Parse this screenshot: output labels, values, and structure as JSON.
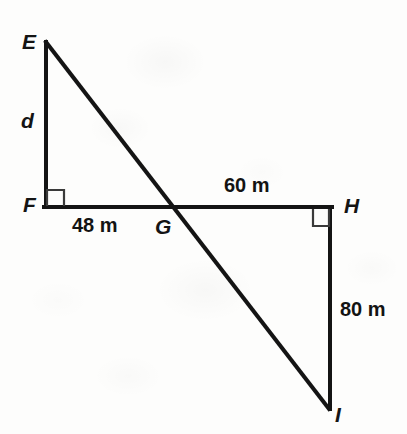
{
  "figure": {
    "type": "geometry-diagram",
    "background_color": "#fdfdfc",
    "stroke_color": "#141414",
    "vertices": [
      {
        "id": "E",
        "label": "E",
        "x": 46,
        "y": 42,
        "style": "italic"
      },
      {
        "id": "F",
        "label": "F",
        "x": 45,
        "y": 207,
        "style": "italic"
      },
      {
        "id": "G",
        "label": "G",
        "x": 173,
        "y": 207,
        "style": "italic"
      },
      {
        "id": "H",
        "label": "H",
        "x": 331,
        "y": 207,
        "style": "italic"
      },
      {
        "id": "I",
        "label": "I",
        "x": 329,
        "y": 409,
        "style": "italic"
      }
    ],
    "segments": [
      {
        "id": "EF",
        "from": "E",
        "to": "F",
        "kind": "leg"
      },
      {
        "id": "FH",
        "from": "F",
        "to": "H",
        "kind": "base"
      },
      {
        "id": "EI",
        "from": "E",
        "to": "I",
        "kind": "transversal"
      },
      {
        "id": "HI",
        "from": "H",
        "to": "I",
        "kind": "leg"
      }
    ],
    "right_angles": [
      {
        "id": "angle-F",
        "at": "F",
        "x": 47,
        "y": 190,
        "size": 17,
        "orientation": "up-right"
      },
      {
        "id": "angle-H",
        "at": "H",
        "x": 313,
        "y": 208,
        "size": 17,
        "orientation": "down-left"
      }
    ],
    "measures": [
      {
        "id": "d",
        "text": "d",
        "segment": "EF",
        "style": "italic",
        "known": false
      },
      {
        "id": "m48",
        "text": "48 m",
        "segment": "FG",
        "style": "upright",
        "known": true,
        "value": 48,
        "unit": "m"
      },
      {
        "id": "m60",
        "text": "60 m",
        "segment": "GH",
        "style": "upright",
        "known": true,
        "value": 60,
        "unit": "m"
      },
      {
        "id": "m80",
        "text": "80 m",
        "segment": "HI",
        "style": "upright",
        "known": true,
        "value": 80,
        "unit": "m"
      }
    ]
  }
}
